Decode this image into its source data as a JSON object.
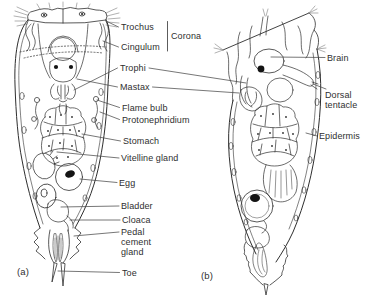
{
  "panels": {
    "a_tag": "(a)",
    "b_tag": "(b)"
  },
  "labels": {
    "trochus": "Trochus",
    "cingulum": "Cingulum",
    "corona": "Corona",
    "trophi": "Trophi",
    "mastax": "Mastax",
    "flame_bulb": "Flame bulb",
    "protonephridium": "Protonephridium",
    "stomach": "Stomach",
    "vitelline_gland": "Vitelline gland",
    "egg": "Egg",
    "bladder": "Bladder",
    "cloaca": "Cloaca",
    "pedal_cement_gland": "Pedal cement gland",
    "toe": "Toe",
    "brain": "Brain",
    "dorsal_tentacle": "Dorsal tentacle",
    "epidermis": "Epidermis"
  },
  "colors": {
    "background": "#ffffff",
    "outline": "#2e2e2e",
    "leader_line": "#4a4a4a",
    "cilia": "#8f8f8f",
    "text": "#2f2f2f",
    "nucleus_fill": "#141414"
  }
}
